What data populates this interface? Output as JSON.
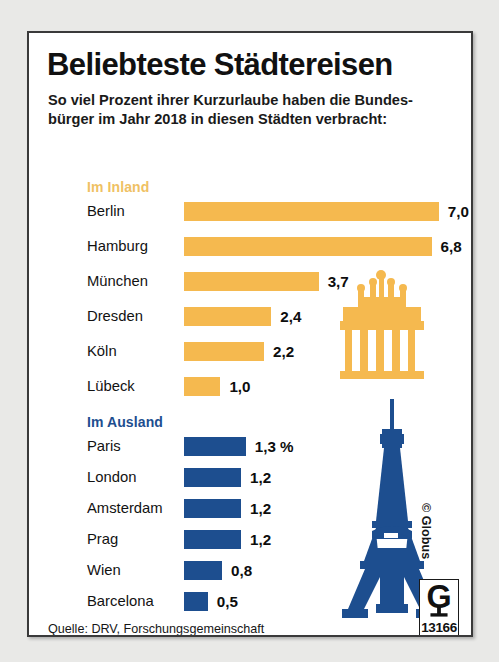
{
  "header": {
    "title": "Beliebteste Städtereisen",
    "subtitle_line1": "So viel Prozent ihrer Kurzurlaube haben die Bundes-",
    "subtitle_line2": "bürger im Jahr 2018 in diesen Städten verbracht:"
  },
  "sections": {
    "inland": {
      "heading": "Im Inland"
    },
    "ausland": {
      "heading": "Im Ausland"
    }
  },
  "footer": {
    "source_line1": "Quelle: DRV, Forschungsgemeinschaft",
    "source_line2": "Urlaub und Reisen (RA Reiseanalyse 2019)",
    "copyright": "© Globus",
    "logo_number": "13166",
    "logo_letter": "G"
  },
  "landmarks": {
    "inland": "brandenburg-gate-icon",
    "ausland": "eiffel-tower-icon"
  },
  "colors": {
    "inland_bar": "#f5b94f",
    "inland_heading": "#efc163",
    "ausland_bar": "#1d4e8f",
    "ausland_heading": "#1d4e8f",
    "card_background": "#ffffff",
    "page_background": "#e9e9e7",
    "text": "#111111"
  },
  "chart_data": [
    {
      "type": "bar",
      "title": "Im Inland",
      "orientation": "horizontal",
      "unit": "%",
      "xlabel": "",
      "ylabel": "",
      "xlim": [
        0,
        7.0
      ],
      "grid": false,
      "legend": false,
      "px_per_unit": 36.4,
      "categories": [
        "Berlin",
        "Hamburg",
        "München",
        "Dresden",
        "Köln",
        "Lübeck"
      ],
      "values": [
        7.0,
        6.8,
        3.7,
        2.4,
        2.2,
        1.0
      ],
      "labels": [
        "7,0 %",
        "6,8",
        "3,7",
        "2,4",
        "2,2",
        "1,0"
      ]
    },
    {
      "type": "bar",
      "title": "Im Ausland",
      "orientation": "horizontal",
      "unit": "%",
      "xlabel": "",
      "ylabel": "",
      "xlim": [
        0,
        1.3
      ],
      "grid": false,
      "legend": false,
      "px_per_unit": 47.5,
      "categories": [
        "Paris",
        "London",
        "Amsterdam",
        "Prag",
        "Wien",
        "Barcelona"
      ],
      "values": [
        1.3,
        1.2,
        1.2,
        1.2,
        0.8,
        0.5
      ],
      "labels": [
        "1,3 %",
        "1,2",
        "1,2",
        "1,2",
        "0,8",
        "0,5"
      ]
    }
  ]
}
